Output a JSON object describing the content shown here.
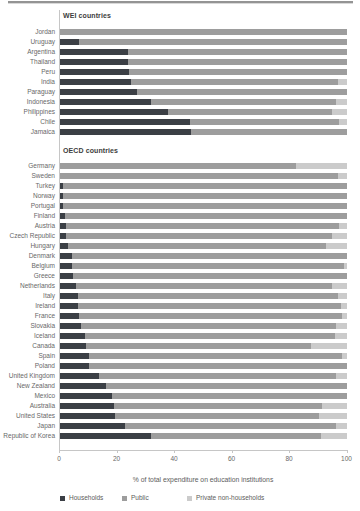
{
  "chart_data": {
    "type": "bar",
    "orientation": "horizontal",
    "stacked": true,
    "title": "",
    "xlabel": "% of total expenditure on education institutions",
    "xlim": [
      0,
      100
    ],
    "x_ticks": [
      0,
      20,
      40,
      60,
      80,
      100
    ],
    "grid": false,
    "legend_position": "bottom",
    "legend": [
      {
        "key": "households",
        "label": "Households",
        "color": "#3b3f45"
      },
      {
        "key": "public",
        "label": "Public",
        "color": "#9d9d9d"
      },
      {
        "key": "private_non_households",
        "label": "Private non-households",
        "color": "#cbcbcb"
      }
    ],
    "groups": [
      {
        "label": "WEI countries",
        "rows": [
          {
            "country": "Jordan",
            "households": 0,
            "public": 100,
            "private_non_households": 0
          },
          {
            "country": "Uruguay",
            "households": 7,
            "public": 93,
            "private_non_households": 0
          },
          {
            "country": "Argentina",
            "households": 24,
            "public": 76,
            "private_non_households": 0
          },
          {
            "country": "Thailand",
            "households": 24,
            "public": 76,
            "private_non_households": 0
          },
          {
            "country": "Peru",
            "households": 24.5,
            "public": 75.5,
            "private_non_households": 0
          },
          {
            "country": "India",
            "households": 25,
            "public": 72,
            "private_non_households": 3
          },
          {
            "country": "Paraguay",
            "households": 27,
            "public": 73,
            "private_non_households": 0
          },
          {
            "country": "Indonesia",
            "households": 32,
            "public": 64.5,
            "private_non_households": 3.5
          },
          {
            "country": "Philippines",
            "households": 38,
            "public": 57,
            "private_non_households": 5
          },
          {
            "country": "Chile",
            "households": 45.5,
            "public": 52,
            "private_non_households": 2.5
          },
          {
            "country": "Jamaica",
            "households": 46,
            "public": 54,
            "private_non_households": 0
          }
        ]
      },
      {
        "label": "OECD countries",
        "rows": [
          {
            "country": "Germany",
            "households": 0,
            "public": 82.5,
            "private_non_households": 17.5
          },
          {
            "country": "Sweden",
            "households": 0,
            "public": 97,
            "private_non_households": 3
          },
          {
            "country": "Turkey",
            "households": 1.5,
            "public": 98.5,
            "private_non_households": 0
          },
          {
            "country": "Norway",
            "households": 1.5,
            "public": 98.5,
            "private_non_households": 0
          },
          {
            "country": "Portugal",
            "households": 1.5,
            "public": 98.5,
            "private_non_households": 0
          },
          {
            "country": "Finland",
            "households": 2,
            "public": 98,
            "private_non_households": 0
          },
          {
            "country": "Austria",
            "households": 2.5,
            "public": 95,
            "private_non_households": 2.5
          },
          {
            "country": "Czech Republic",
            "households": 2.5,
            "public": 92.5,
            "private_non_households": 5
          },
          {
            "country": "Hungary",
            "households": 3,
            "public": 90,
            "private_non_households": 7
          },
          {
            "country": "Denmark",
            "households": 4.5,
            "public": 95.5,
            "private_non_households": 0
          },
          {
            "country": "Belgium",
            "households": 4.5,
            "public": 94.5,
            "private_non_households": 1
          },
          {
            "country": "Greece",
            "households": 5,
            "public": 95,
            "private_non_households": 0
          },
          {
            "country": "Netherlands",
            "households": 6,
            "public": 89,
            "private_non_households": 5
          },
          {
            "country": "Italy",
            "households": 6.5,
            "public": 90.5,
            "private_non_households": 3
          },
          {
            "country": "Ireland",
            "households": 6.5,
            "public": 91.5,
            "private_non_households": 2
          },
          {
            "country": "France",
            "households": 7,
            "public": 91.5,
            "private_non_households": 1.5
          },
          {
            "country": "Slovakia",
            "households": 7.5,
            "public": 89,
            "private_non_households": 3.5
          },
          {
            "country": "Iceland",
            "households": 9,
            "public": 87,
            "private_non_households": 4
          },
          {
            "country": "Canada",
            "households": 9.5,
            "public": 78,
            "private_non_households": 12.5
          },
          {
            "country": "Spain",
            "households": 10.5,
            "public": 88,
            "private_non_households": 1.5
          },
          {
            "country": "Poland",
            "households": 10.5,
            "public": 89.5,
            "private_non_households": 0
          },
          {
            "country": "United Kingdom",
            "households": 14,
            "public": 82.5,
            "private_non_households": 3.5
          },
          {
            "country": "New Zealand",
            "households": 16.5,
            "public": 83.5,
            "private_non_households": 0
          },
          {
            "country": "Mexico",
            "households": 18.5,
            "public": 81.5,
            "private_non_households": 0
          },
          {
            "country": "Australia",
            "households": 19,
            "public": 72.5,
            "private_non_households": 8.5
          },
          {
            "country": "United States",
            "households": 19.5,
            "public": 71,
            "private_non_households": 9.5
          },
          {
            "country": "Japan",
            "households": 23,
            "public": 73.5,
            "private_non_households": 3.5
          },
          {
            "country": "Republic of Korea",
            "households": 32,
            "public": 59,
            "private_non_households": 9
          }
        ]
      }
    ]
  }
}
